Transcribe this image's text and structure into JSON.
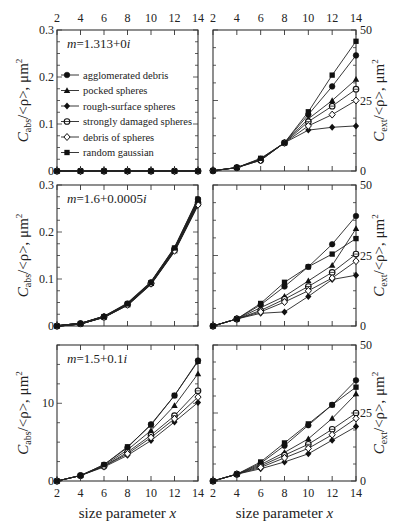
{
  "chart_data": {
    "type": "line",
    "x": [
      2,
      4,
      6,
      8,
      10,
      12,
      14
    ],
    "xlabel": "size parameter x",
    "top_xticks": [
      "2",
      "4",
      "6",
      "8",
      "10",
      "12",
      "14"
    ],
    "bottom_xticks": [
      "2",
      "4",
      "6",
      "8",
      "10",
      "12",
      "14"
    ],
    "legend": [
      {
        "name": "agglomerated debris",
        "marker": "circle-filled"
      },
      {
        "name": "pocked spheres",
        "marker": "triangle-filled"
      },
      {
        "name": "rough-surface spheres",
        "marker": "diamond-filled"
      },
      {
        "name": "strongly damaged spheres",
        "marker": "circle-cross"
      },
      {
        "name": "debris of spheres",
        "marker": "diamond-open"
      },
      {
        "name": "random gaussian",
        "marker": "square-filled"
      }
    ],
    "panels": [
      {
        "id": "abs-row1",
        "row": 1,
        "side": "left",
        "annotation": "m=1.313+0i",
        "ylabel": "C_abs/<ρ>, μm²",
        "ylim": [
          0,
          0.3
        ],
        "yticks": [
          "0",
          "0.1",
          "0.2",
          "0.3"
        ],
        "series": [
          {
            "name": "agglomerated debris",
            "values": [
              0,
              0,
              0,
              0,
              0,
              0,
              0
            ]
          },
          {
            "name": "pocked spheres",
            "values": [
              0,
              0,
              0,
              0,
              0,
              0,
              0
            ]
          },
          {
            "name": "rough-surface spheres",
            "values": [
              0,
              0,
              0,
              0,
              0,
              0,
              0
            ]
          },
          {
            "name": "strongly damaged spheres",
            "values": [
              0,
              0,
              0,
              0,
              0,
              0,
              0
            ]
          },
          {
            "name": "debris of spheres",
            "values": [
              0,
              0,
              0,
              0,
              0,
              0,
              0
            ]
          },
          {
            "name": "random gaussian",
            "values": [
              0,
              0,
              0,
              0,
              0,
              0,
              0
            ]
          }
        ]
      },
      {
        "id": "ext-row1",
        "row": 1,
        "side": "right",
        "ylabel": "C_ext/<ρ>, μm²",
        "ylim": [
          0,
          50
        ],
        "yticks": [
          "0",
          "25",
          "50"
        ],
        "series": [
          {
            "name": "agglomerated debris",
            "values": [
              0.1,
              1.2,
              4.3,
              10,
              20,
              30,
              41
            ]
          },
          {
            "name": "pocked spheres",
            "values": [
              0.1,
              1.2,
              4,
              10,
              18.5,
              25,
              32.5
            ]
          },
          {
            "name": "rough-surface spheres",
            "values": [
              0.1,
              1.2,
              4.2,
              10,
              14.5,
              15.5,
              16
            ]
          },
          {
            "name": "strongly damaged spheres",
            "values": [
              0.1,
              1.2,
              3.8,
              10,
              17.5,
              23,
              29
            ]
          },
          {
            "name": "debris of spheres",
            "values": [
              0.1,
              1.2,
              3.8,
              10,
              16,
              20,
              25
            ]
          },
          {
            "name": "random gaussian",
            "values": [
              0.1,
              1.2,
              4.5,
              10,
              21,
              34,
              46
            ]
          }
        ]
      },
      {
        "id": "abs-row2",
        "row": 2,
        "side": "left",
        "annotation": "m=1.6+0.0005i",
        "ylabel": "C_abs/<ρ>, μm²",
        "ylim": [
          0,
          0.3
        ],
        "yticks": [
          "0",
          "0.1",
          "0.2",
          "0.3"
        ],
        "series": [
          {
            "name": "agglomerated debris",
            "values": [
              0,
              0.005,
              0.02,
              0.048,
              0.093,
              0.165,
              0.27
            ]
          },
          {
            "name": "pocked spheres",
            "values": [
              0,
              0.005,
              0.019,
              0.045,
              0.09,
              0.16,
              0.26
            ]
          },
          {
            "name": "rough-surface spheres",
            "values": [
              0,
              0.005,
              0.02,
              0.046,
              0.092,
              0.163,
              0.265
            ]
          },
          {
            "name": "strongly damaged spheres",
            "values": [
              0,
              0.005,
              0.019,
              0.046,
              0.091,
              0.162,
              0.262
            ]
          },
          {
            "name": "debris of spheres",
            "values": [
              0,
              0.005,
              0.019,
              0.045,
              0.09,
              0.16,
              0.258
            ]
          },
          {
            "name": "random gaussian",
            "values": [
              0,
              0.005,
              0.02,
              0.047,
              0.092,
              0.166,
              0.268
            ]
          }
        ]
      },
      {
        "id": "ext-row2",
        "row": 2,
        "side": "right",
        "ylabel": "C_ext/<ρ>, μm²",
        "ylim": [
          0,
          50
        ],
        "yticks": [
          "0",
          "25",
          "50"
        ],
        "series": [
          {
            "name": "agglomerated debris",
            "values": [
              0,
              2.5,
              7.5,
              14,
              21,
              29,
              39
            ]
          },
          {
            "name": "pocked spheres",
            "values": [
              0,
              2.5,
              6.5,
              10.5,
              16,
              21.5,
              34.5
            ]
          },
          {
            "name": "rough-surface spheres",
            "values": [
              0,
              2.5,
              4.5,
              5,
              10.5,
              16.5,
              18
            ]
          },
          {
            "name": "strongly damaged spheres",
            "values": [
              0,
              2.5,
              5.5,
              9.5,
              14,
              19,
              25.5
            ]
          },
          {
            "name": "debris of spheres",
            "values": [
              0,
              2.5,
              5,
              8.5,
              12.5,
              17,
              23
            ]
          },
          {
            "name": "random gaussian",
            "values": [
              0,
              2.5,
              8,
              15.5,
              21,
              25.5,
              31
            ]
          }
        ]
      },
      {
        "id": "abs-row3",
        "row": 3,
        "side": "left",
        "annotation": "m=1.5+0.1i",
        "ylabel": "C_abs/<ρ>, μm²",
        "ylim": [
          0,
          17.5
        ],
        "yticks": [
          "0",
          "10"
        ],
        "series": [
          {
            "name": "agglomerated debris",
            "values": [
              0,
              0.7,
              2.1,
              4.3,
              7.3,
              11,
              15.5
            ]
          },
          {
            "name": "pocked spheres",
            "values": [
              0,
              0.7,
              2,
              4,
              6.5,
              9.7,
              13.8
            ]
          },
          {
            "name": "rough-surface spheres",
            "values": [
              0,
              0.7,
              1.8,
              3.3,
              5.2,
              7.6,
              10.1
            ]
          },
          {
            "name": "strongly damaged spheres",
            "values": [
              0,
              0.7,
              1.9,
              3.7,
              5.9,
              8.4,
              11.6
            ]
          },
          {
            "name": "debris of spheres",
            "values": [
              0,
              0.7,
              1.9,
              3.5,
              5.6,
              8,
              10.8
            ]
          },
          {
            "name": "random gaussian",
            "values": [
              0,
              0.7,
              2.1,
              4.4,
              7.2,
              11,
              15.4
            ]
          }
        ]
      },
      {
        "id": "ext-row3",
        "row": 3,
        "side": "right",
        "ylabel": "C_ext/<ρ>, μm²",
        "ylim": [
          0,
          50
        ],
        "yticks": [
          "0",
          "25",
          "50"
        ],
        "series": [
          {
            "name": "agglomerated debris",
            "values": [
              0,
              2.5,
              6.5,
              13,
              20.5,
              28,
              37
            ]
          },
          {
            "name": "pocked spheres",
            "values": [
              0,
              2.5,
              6,
              10.5,
              15.5,
              23,
              32
            ]
          },
          {
            "name": "rough-surface spheres",
            "values": [
              0,
              2.5,
              4.5,
              7,
              10,
              15,
              20
            ]
          },
          {
            "name": "strongly damaged spheres",
            "values": [
              0,
              2.5,
              5.5,
              9.5,
              13.5,
              19,
              25
            ]
          },
          {
            "name": "debris of spheres",
            "values": [
              0,
              2.5,
              5,
              8.5,
              12,
              17,
              23
            ]
          },
          {
            "name": "random gaussian",
            "values": [
              0,
              2.5,
              7,
              14,
              21,
              28,
              34.5
            ]
          }
        ]
      }
    ]
  },
  "labels": {
    "xlabel_left": "size parameter x",
    "xlabel_right": "size parameter x"
  }
}
